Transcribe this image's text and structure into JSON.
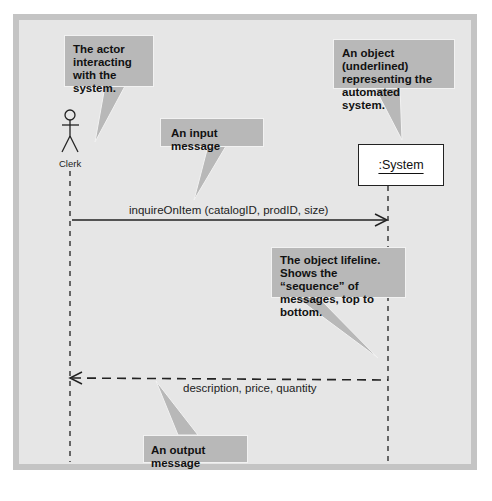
{
  "diagram": {
    "type": "sequence-diagram",
    "actor": {
      "name": "Clerk"
    },
    "object": {
      "name": ":System"
    },
    "messages": [
      {
        "direction": "input",
        "label": "inquireOnItem (catalogID, prodID, size)",
        "style": "solid"
      },
      {
        "direction": "output",
        "label": "description, price, quantity",
        "style": "dashed"
      }
    ],
    "callouts": [
      {
        "id": "actor-note",
        "text": "The actor interacting with the system."
      },
      {
        "id": "object-note",
        "text": "An object (underlined) representing the automated system."
      },
      {
        "id": "input-note",
        "text": "An input message"
      },
      {
        "id": "lifeline-note",
        "text": "The object lifeline. Shows the “sequence” of messages, top to bottom."
      },
      {
        "id": "output-note",
        "text": "An output message"
      }
    ],
    "colors": {
      "background": "#e6e6e6",
      "frame_border": "#c4c4c4",
      "callout_fill": "#b8b8b8",
      "line": "#222222"
    }
  }
}
